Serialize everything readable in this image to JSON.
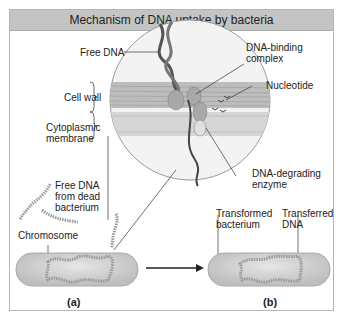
{
  "title": "Mechanism of DNA uptake by bacteria",
  "labels": {
    "free_dna": "Free DNA",
    "cell_wall": "Cell wall",
    "cytoplasmic_membrane_1": "Cytoplasmic",
    "cytoplasmic_membrane_2": "membrane",
    "dna_binding_complex_1": "DNA-binding",
    "dna_binding_complex_2": "complex",
    "nucleotide": "Nucleotide",
    "dna_degrading_enzyme_1": "DNA-degrading",
    "dna_degrading_enzyme_2": "enzyme",
    "free_dna_dead_1": "Free DNA",
    "free_dna_dead_2": "from dead",
    "free_dna_dead_3": "bacterium",
    "chromosome": "Chromosome",
    "transformed_bacterium_1": "Transformed",
    "transformed_bacterium_2": "bacterium",
    "transferred_dna_1": "Transferred",
    "transferred_dna_2": "DNA"
  },
  "panels": {
    "a": "(a)",
    "b": "(b)"
  },
  "colors": {
    "title_bg": "#c4c4c4",
    "cell": "#d2d2d2",
    "wall": "#b8b8b8",
    "membrane": "#d8d8d8",
    "dna": "#555555"
  }
}
